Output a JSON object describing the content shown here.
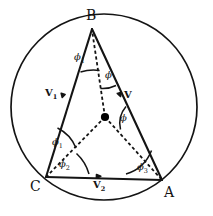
{
  "figure": {
    "type": "geometry-diagram",
    "stroke_color": "#141414",
    "background": "#ffffff",
    "dot_color": "#000000"
  },
  "vertices": {
    "B": {
      "label": "B",
      "x": 92,
      "y": 27
    },
    "C": {
      "label": "C",
      "x": 46,
      "y": 177
    },
    "A": {
      "label": "A",
      "x": 162,
      "y": 180
    }
  },
  "circle": {
    "cx": 104,
    "cy": 107,
    "r": 93
  },
  "center_point": {
    "x": 105,
    "y": 117,
    "label": ""
  },
  "angle_labels": [
    {
      "name": "phi-1-at-B",
      "text": "ϕ",
      "sub": "1",
      "x": 76,
      "y": 56
    },
    {
      "name": "phi-upper-right",
      "text": "ϕ",
      "sub": "",
      "x": 106,
      "y": 74
    },
    {
      "name": "phi-lower-right",
      "text": "ϕ",
      "sub": "",
      "x": 121,
      "y": 117
    },
    {
      "name": "phi-1-at-C",
      "text": "ϕ",
      "sub": "1",
      "x": 54,
      "y": 141
    },
    {
      "name": "phi-2-at-C",
      "text": "ϕ",
      "sub": "2",
      "x": 61,
      "y": 163
    },
    {
      "name": "phi-3-at-A",
      "text": "ϕ",
      "sub": "3",
      "x": 139,
      "y": 166
    }
  ],
  "vector_labels": [
    {
      "name": "vector-v1",
      "text": "V",
      "sub": "1",
      "x": 48,
      "y": 92
    },
    {
      "name": "vector-v",
      "text": "V",
      "sub": "",
      "x": 127,
      "y": 95
    },
    {
      "name": "vector-v2",
      "text": "V",
      "sub": "2",
      "x": 96,
      "y": 184
    }
  ]
}
